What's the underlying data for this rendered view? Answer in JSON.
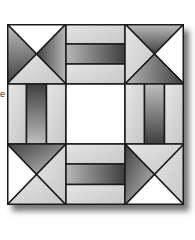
{
  "diagram": {
    "type": "quilt-block",
    "grid": "3x3",
    "edge_text": "e",
    "colors": {
      "outline": "#1a1a1a",
      "white": "#ffffff",
      "light": "#d8d8d8",
      "dark_start": "#4a4a4a",
      "dark_end": "#bdbdbd"
    },
    "cells": [
      {
        "pos": "top-left",
        "type": "hourglass",
        "top": "white",
        "left": "dark",
        "right": "dark",
        "bottom": "light"
      },
      {
        "pos": "top-center",
        "type": "rail-horizontal",
        "bars": [
          "light",
          "dark",
          "light"
        ]
      },
      {
        "pos": "top-right",
        "type": "hourglass",
        "top": "dark",
        "left": "light",
        "right": "white",
        "bottom": "dark"
      },
      {
        "pos": "middle-left",
        "type": "rail-vertical",
        "bars": [
          "light",
          "dark",
          "light"
        ]
      },
      {
        "pos": "center",
        "type": "plain",
        "fill": "white"
      },
      {
        "pos": "middle-right",
        "type": "rail-vertical",
        "bars": [
          "light",
          "dark",
          "light"
        ]
      },
      {
        "pos": "bottom-left",
        "type": "hourglass",
        "top": "dark",
        "left": "white",
        "right": "light",
        "bottom": "light"
      },
      {
        "pos": "bottom-center",
        "type": "rail-horizontal",
        "bars": [
          "light",
          "dark",
          "light"
        ]
      },
      {
        "pos": "bottom-right",
        "type": "hourglass",
        "top": "light",
        "left": "dark",
        "right": "light",
        "bottom": "white"
      }
    ]
  }
}
